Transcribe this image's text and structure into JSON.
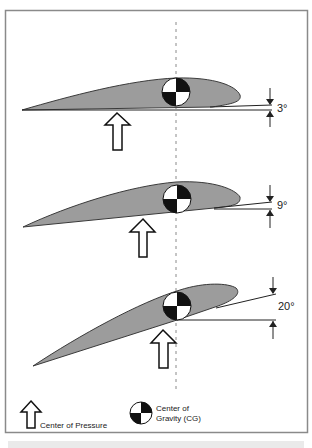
{
  "figure": {
    "colors": {
      "frame": "#8a8a8a",
      "airfoil_fill": "#9c9c9c",
      "airfoil_stroke": "#3a3a3a",
      "line": "#222222",
      "dash": "#8a8a8a"
    },
    "panels": [
      {
        "angle_label": "3°"
      },
      {
        "angle_label": "9°"
      },
      {
        "angle_label": "20°"
      }
    ],
    "legend": {
      "pressure_label": "Center of Pressure",
      "cg_label_line1": "Center of",
      "cg_label_line2": "Gravity (CG)"
    }
  }
}
